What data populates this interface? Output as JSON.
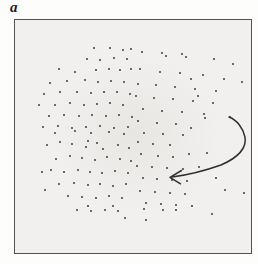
{
  "panel": {
    "label": "a"
  },
  "figure": {
    "frame": {
      "x": 14,
      "y": 19,
      "width": 238,
      "height": 235,
      "border_color": "#525252",
      "border_width": 1.5,
      "fill_color": "#f1f0ee",
      "haze_color": "#e7e6e3",
      "outer_background": "#fdfdfc"
    },
    "dots": {
      "color": "#2b2b2b",
      "radius": 0.9,
      "points": [
        [
          94,
          48
        ],
        [
          110,
          48
        ],
        [
          123,
          50
        ],
        [
          131,
          49
        ],
        [
          142,
          52
        ],
        [
          162,
          53
        ],
        [
          182,
          54
        ],
        [
          87,
          59
        ],
        [
          100,
          60
        ],
        [
          114,
          58
        ],
        [
          127,
          59
        ],
        [
          166,
          56
        ],
        [
          186,
          57
        ],
        [
          214,
          59
        ],
        [
          233,
          64
        ],
        [
          59,
          69
        ],
        [
          75,
          72
        ],
        [
          96,
          70
        ],
        [
          109,
          69
        ],
        [
          120,
          70
        ],
        [
          131,
          69
        ],
        [
          140,
          69
        ],
        [
          160,
          72
        ],
        [
          180,
          73
        ],
        [
          203,
          75
        ],
        [
          224,
          79
        ],
        [
          191,
          79
        ],
        [
          50,
          83
        ],
        [
          67,
          81
        ],
        [
          85,
          80
        ],
        [
          98,
          82
        ],
        [
          111,
          81
        ],
        [
          124,
          82
        ],
        [
          138,
          84
        ],
        [
          156,
          85
        ],
        [
          175,
          87
        ],
        [
          195,
          89
        ],
        [
          216,
          91
        ],
        [
          242,
          82
        ],
        [
          44,
          94
        ],
        [
          60,
          92
        ],
        [
          77,
          92
        ],
        [
          91,
          93
        ],
        [
          104,
          92
        ],
        [
          117,
          92
        ],
        [
          130,
          94
        ],
        [
          136,
          96
        ],
        [
          154,
          98
        ],
        [
          173,
          99
        ],
        [
          193,
          101
        ],
        [
          213,
          103
        ],
        [
          198,
          96
        ],
        [
          39,
          105
        ],
        [
          55,
          105
        ],
        [
          70,
          103
        ],
        [
          84,
          105
        ],
        [
          97,
          104
        ],
        [
          110,
          103
        ],
        [
          123,
          105
        ],
        [
          143,
          109
        ],
        [
          162,
          111
        ],
        [
          182,
          112
        ],
        [
          204,
          114
        ],
        [
          49,
          116
        ],
        [
          64,
          115
        ],
        [
          79,
          116
        ],
        [
          92,
          115
        ],
        [
          106,
          116
        ],
        [
          119,
          115
        ],
        [
          132,
          117
        ],
        [
          230,
          117
        ],
        [
          138,
          121
        ],
        [
          157,
          123
        ],
        [
          176,
          124
        ],
        [
          43,
          127
        ],
        [
          58,
          126
        ],
        [
          72,
          128
        ],
        [
          86,
          127
        ],
        [
          100,
          126
        ],
        [
          114,
          128
        ],
        [
          128,
          127
        ],
        [
          191,
          128
        ],
        [
          205,
          118
        ],
        [
          55,
          133
        ],
        [
          75,
          131
        ],
        [
          91,
          133
        ],
        [
          109,
          132
        ],
        [
          124,
          134
        ],
        [
          144,
          133
        ],
        [
          163,
          134
        ],
        [
          183,
          135
        ],
        [
          47,
          145
        ],
        [
          72,
          144
        ],
        [
          86,
          147
        ],
        [
          97,
          143
        ],
        [
          103,
          149
        ],
        [
          118,
          145
        ],
        [
          129,
          148
        ],
        [
          138,
          142
        ],
        [
          153,
          144
        ],
        [
          170,
          145
        ],
        [
          60,
          142
        ],
        [
          88,
          141
        ],
        [
          56,
          159
        ],
        [
          70,
          156
        ],
        [
          82,
          158
        ],
        [
          95,
          160
        ],
        [
          107,
          157
        ],
        [
          120,
          159
        ],
        [
          131,
          161
        ],
        [
          141,
          154
        ],
        [
          158,
          156
        ],
        [
          173,
          157
        ],
        [
          189,
          154
        ],
        [
          207,
          153
        ],
        [
          51,
          170
        ],
        [
          64,
          172
        ],
        [
          78,
          170
        ],
        [
          90,
          172
        ],
        [
          102,
          173
        ],
        [
          115,
          171
        ],
        [
          128,
          173
        ],
        [
          137,
          166
        ],
        [
          152,
          167
        ],
        [
          167,
          168
        ],
        [
          183,
          169
        ],
        [
          199,
          167
        ],
        [
          42,
          172
        ],
        [
          59,
          184
        ],
        [
          74,
          183
        ],
        [
          88,
          185
        ],
        [
          100,
          184
        ],
        [
          113,
          186
        ],
        [
          126,
          184
        ],
        [
          143,
          178
        ],
        [
          157,
          179
        ],
        [
          172,
          180
        ],
        [
          187,
          181
        ],
        [
          216,
          178
        ],
        [
          68,
          196
        ],
        [
          82,
          197
        ],
        [
          96,
          198
        ],
        [
          109,
          196
        ],
        [
          122,
          198
        ],
        [
          140,
          191
        ],
        [
          155,
          192
        ],
        [
          170,
          193
        ],
        [
          185,
          194
        ],
        [
          225,
          190
        ],
        [
          244,
          193
        ],
        [
          45,
          190
        ],
        [
          146,
          203
        ],
        [
          161,
          204
        ],
        [
          176,
          205
        ],
        [
          192,
          206
        ],
        [
          113,
          206
        ],
        [
          88,
          206
        ],
        [
          77,
          210
        ],
        [
          91,
          211
        ],
        [
          105,
          210
        ],
        [
          118,
          211
        ],
        [
          144,
          209
        ],
        [
          163,
          210
        ],
        [
          176,
          210
        ],
        [
          212,
          214
        ],
        [
          125,
          218
        ],
        [
          146,
          220
        ]
      ]
    },
    "arrow": {
      "color": "#2f2f2f",
      "stroke_width": 1.5,
      "curve_d": "M 229 117 C 237 120 243 128 245 137 C 247 149 237 158 221 165 C 204 171 188 175 172 177",
      "head_d": "M 181.5 170.5 L 170 177.3 L 180.5 183.8"
    }
  }
}
